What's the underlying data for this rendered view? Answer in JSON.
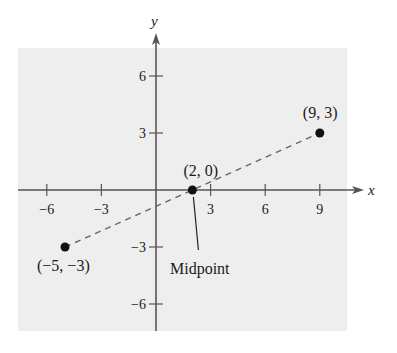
{
  "chart_data": {
    "type": "scatter",
    "title": "",
    "xlabel": "x",
    "ylabel": "y",
    "xlim": [
      -7.5,
      11
    ],
    "ylim": [
      -7.5,
      7.5
    ],
    "grid": false,
    "x_ticks": [
      -6,
      -3,
      3,
      6,
      9
    ],
    "x_tick_labels": [
      "−6",
      "−3",
      "3",
      "6",
      "9"
    ],
    "y_ticks": [
      6,
      3,
      -3,
      -6
    ],
    "y_tick_labels": [
      "6",
      "3",
      "−3",
      "−6"
    ],
    "points": [
      {
        "x": -5,
        "y": -3,
        "label": "(−5, −3)"
      },
      {
        "x": 2,
        "y": 0,
        "label": "(2, 0)"
      },
      {
        "x": 9,
        "y": 3,
        "label": "(9, 3)"
      }
    ],
    "segments": [
      {
        "from": [
          -5,
          -3
        ],
        "to": [
          9,
          3
        ],
        "style": "dashed"
      }
    ],
    "annotations": [
      {
        "text": "Midpoint",
        "points_to": [
          2,
          0
        ]
      }
    ]
  },
  "colors": {
    "background": "#ffffff",
    "plot_area": "#eeeeee",
    "axis": "#555555",
    "point": "#111111",
    "dash": "#666666",
    "text": "#1a1a1a"
  }
}
